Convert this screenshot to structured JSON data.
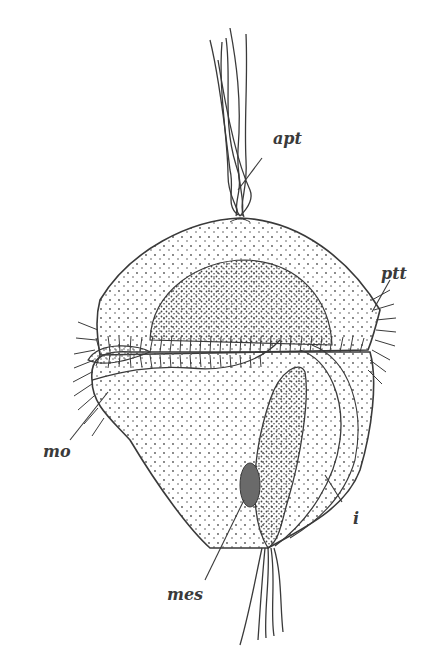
{
  "figure": {
    "ink_color": "#3a3a3a",
    "stipple_color": "#555555",
    "mesoderm_fill": "#6a6a6a"
  },
  "labels": {
    "apt": {
      "text": "apt",
      "x": 273,
      "y": 131
    },
    "ptt": {
      "text": "ptt",
      "x": 381,
      "y": 266
    },
    "mo": {
      "text": "mo",
      "x": 43,
      "y": 444
    },
    "i": {
      "text": "i",
      "x": 353,
      "y": 511
    },
    "mes": {
      "text": "mes",
      "x": 167,
      "y": 587
    }
  }
}
